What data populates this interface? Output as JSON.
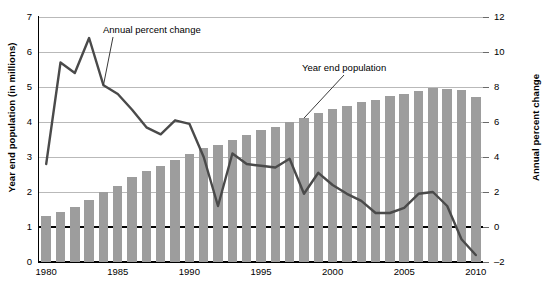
{
  "chart_data": {
    "type": "bar",
    "title": "",
    "subtitle": "",
    "xlabel": "",
    "ylabel": "Year end population (in millions)",
    "ylabel_right": "Annual percent change",
    "grid": true,
    "legend_position": "inline-annotations",
    "x": [
      1980,
      1981,
      1982,
      1983,
      1984,
      1985,
      1986,
      1987,
      1988,
      1989,
      1990,
      1991,
      1992,
      1993,
      1994,
      1995,
      1996,
      1997,
      1998,
      1999,
      2000,
      2001,
      2002,
      2003,
      2004,
      2005,
      2006,
      2007,
      2008,
      2009,
      2010
    ],
    "xlim": [
      1979.5,
      2010.5
    ],
    "xticks": [
      1980,
      1985,
      1990,
      1995,
      2000,
      2005,
      2010
    ],
    "xticklabels": [
      "1980",
      "1985",
      "1990",
      "1995",
      "2000",
      "2005",
      "2010"
    ],
    "ylim": [
      0,
      7
    ],
    "yticks": [
      0,
      1,
      2,
      3,
      4,
      5,
      6,
      7
    ],
    "yticklabels": [
      "0",
      "1",
      "2",
      "3",
      "4",
      "5",
      "6",
      "7"
    ],
    "ylim_right": [
      -2,
      12
    ],
    "yticks_right": [
      -2,
      0,
      2,
      4,
      6,
      8,
      10,
      12
    ],
    "yticklabels_right": [
      "-2",
      "0",
      "2",
      "4",
      "6",
      "8",
      "10",
      "12"
    ],
    "series": [
      {
        "name": "Year end population",
        "type": "bar",
        "axis": "left",
        "unit": "millions",
        "color": "#9d9d9d",
        "values": [
          1.32,
          1.42,
          1.58,
          1.76,
          2.0,
          2.18,
          2.42,
          2.6,
          2.75,
          2.92,
          3.1,
          3.27,
          3.33,
          3.5,
          3.64,
          3.78,
          3.87,
          3.99,
          4.11,
          4.26,
          4.36,
          4.46,
          4.57,
          4.64,
          4.73,
          4.8,
          4.89,
          4.96,
          4.95,
          4.92,
          4.72
        ]
      },
      {
        "name": "Annual percent change",
        "type": "line",
        "axis": "right",
        "unit": "percent",
        "color": "#4a4a4a",
        "values": [
          3.6,
          9.4,
          8.8,
          10.8,
          8.1,
          7.6,
          6.7,
          5.7,
          5.3,
          6.1,
          5.9,
          4.0,
          1.2,
          4.2,
          3.6,
          3.5,
          3.4,
          3.9,
          1.9,
          3.1,
          2.4,
          1.9,
          1.5,
          0.8,
          0.8,
          1.1,
          1.9,
          2.0,
          1.2,
          -0.7,
          -1.6
        ]
      }
    ],
    "annotations": [
      {
        "text": "Annual percent change",
        "points_to_year": 1984,
        "points_to_value": 8.1
      },
      {
        "text": "Year end population",
        "points_to_year": 1998,
        "points_to_value": 4.11
      }
    ]
  },
  "labels": {
    "y_axis_left": "Year end population (in millions)",
    "y_axis_right": "Annual percent change",
    "annotation_line": "Annual percent change",
    "annotation_bars": "Year end population"
  }
}
